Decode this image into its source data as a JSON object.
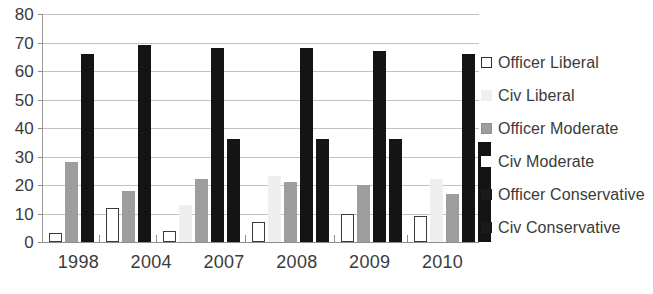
{
  "chart_data": {
    "type": "bar",
    "title": "",
    "subtitle": "",
    "xlabel": "",
    "ylabel": "",
    "categories": [
      "1998",
      "2004",
      "2007",
      "2008",
      "2009",
      "2010"
    ],
    "ylim": [
      0,
      80
    ],
    "yticks": [
      0,
      10,
      20,
      30,
      40,
      50,
      60,
      70,
      80
    ],
    "ytick_labels": [
      "0",
      "10",
      "20",
      "30",
      "40",
      "50",
      "60",
      "70",
      "80"
    ],
    "grid": true,
    "legend_position": "right",
    "series": [
      {
        "name": "Officer Liberal",
        "color": "#ffffff",
        "border": "#2e2e2e",
        "swatch": "officer-liberal",
        "values": [
          3,
          12,
          4,
          7,
          10,
          9
        ]
      },
      {
        "name": "Civ Liberal",
        "color": "#efefef",
        "border": "#efefef",
        "swatch": "civ-liberal",
        "values": [
          0,
          0,
          13,
          23,
          0,
          22
        ]
      },
      {
        "name": "Officer Moderate",
        "color": "#9d9d9d",
        "border": "#8f8f8f",
        "swatch": "officer-moderate",
        "values": [
          28,
          18,
          22,
          21,
          20,
          17
        ]
      },
      {
        "name": "Civ Moderate",
        "color": "#ffffff",
        "border": "#ffffff",
        "swatch": "civ-moderate",
        "values": [
          0,
          0,
          0,
          0,
          0,
          0
        ]
      },
      {
        "name": "Officer Conservative",
        "color": "#1a1a1a",
        "border": "#1a1a1a",
        "swatch": "officer-conservative",
        "values": [
          66,
          69,
          68,
          68,
          67,
          66
        ]
      },
      {
        "name": "Civ Conservative",
        "color": "#1a1a1a",
        "border": "#1a1a1a",
        "swatch": "civ-conservative",
        "values": [
          0,
          0,
          36,
          36,
          36,
          35
        ]
      }
    ]
  },
  "legend": {
    "items": [
      {
        "label": "Officer Liberal",
        "swatch": "officer-liberal"
      },
      {
        "label": "Civ Liberal",
        "swatch": "civ-liberal"
      },
      {
        "label": "Officer Moderate",
        "swatch": "officer-moderate"
      },
      {
        "label": "Civ Moderate",
        "swatch": "civ-moderate"
      },
      {
        "label": "Officer Conservative",
        "swatch": "officer-conservative"
      },
      {
        "label": "Civ Conservative",
        "swatch": "civ-conservative"
      }
    ]
  },
  "colors": {
    "axis": "#8d8d8d",
    "grid": "#c2c2c2",
    "text": "#3b3b3b",
    "background": "#ffffff"
  }
}
